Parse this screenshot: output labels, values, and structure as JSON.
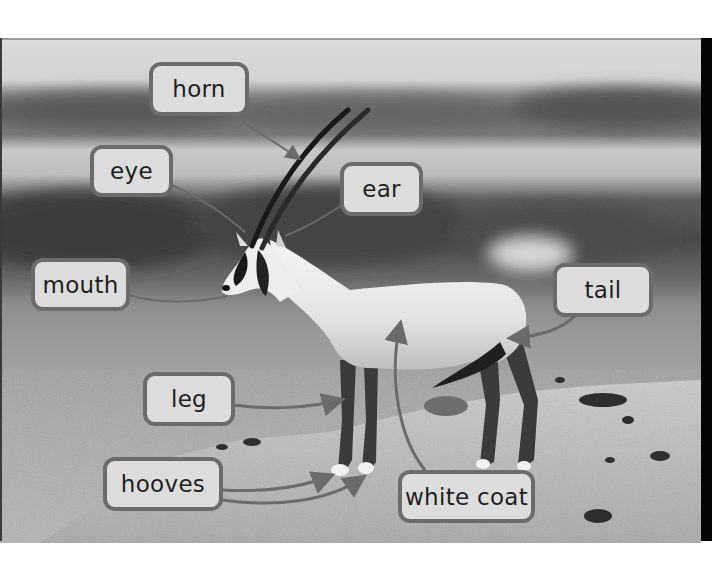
{
  "figure": {
    "style": "grayscale labeled photograph",
    "colors": {
      "label_fill": "#dcdcdc",
      "label_border": "#6b6b6b",
      "label_text": "#1e1e1e",
      "arrow": "#6b6b6b"
    }
  },
  "labels": [
    {
      "id": "horn",
      "text": "horn"
    },
    {
      "id": "eye",
      "text": "eye"
    },
    {
      "id": "ear",
      "text": "ear"
    },
    {
      "id": "mouth",
      "text": "mouth"
    },
    {
      "id": "tail",
      "text": "tail"
    },
    {
      "id": "leg",
      "text": "leg"
    },
    {
      "id": "hooves",
      "text": "hooves"
    },
    {
      "id": "white-coat",
      "text": "white coat"
    }
  ]
}
